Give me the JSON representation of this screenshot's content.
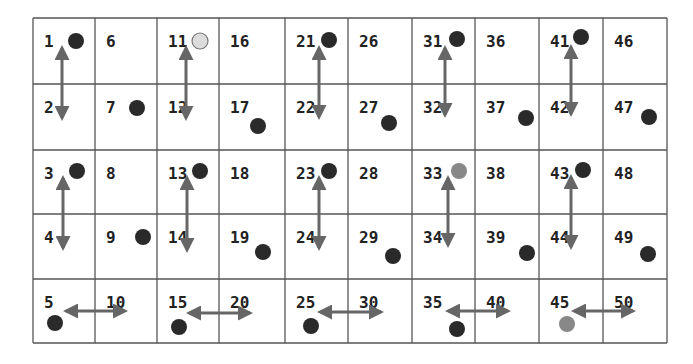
{
  "grid": {
    "columns": 10,
    "rows": 5,
    "col_edges": [
      33,
      95,
      157,
      219,
      285,
      348,
      412,
      475,
      539,
      603,
      667
    ],
    "row_edges": [
      18,
      84,
      150,
      214,
      279,
      343
    ],
    "line_color": "#555555",
    "background": "#ffffff"
  },
  "cells": [
    {
      "n": "1",
      "col": 0,
      "row": 0
    },
    {
      "n": "2",
      "col": 0,
      "row": 1
    },
    {
      "n": "3",
      "col": 0,
      "row": 2
    },
    {
      "n": "4",
      "col": 0,
      "row": 3
    },
    {
      "n": "5",
      "col": 0,
      "row": 4
    },
    {
      "n": "6",
      "col": 1,
      "row": 0
    },
    {
      "n": "7",
      "col": 1,
      "row": 1
    },
    {
      "n": "8",
      "col": 1,
      "row": 2
    },
    {
      "n": "9",
      "col": 1,
      "row": 3
    },
    {
      "n": "10",
      "col": 1,
      "row": 4
    },
    {
      "n": "11",
      "col": 2,
      "row": 0
    },
    {
      "n": "12",
      "col": 2,
      "row": 1
    },
    {
      "n": "13",
      "col": 2,
      "row": 2
    },
    {
      "n": "14",
      "col": 2,
      "row": 3
    },
    {
      "n": "15",
      "col": 2,
      "row": 4
    },
    {
      "n": "16",
      "col": 3,
      "row": 0
    },
    {
      "n": "17",
      "col": 3,
      "row": 1
    },
    {
      "n": "18",
      "col": 3,
      "row": 2
    },
    {
      "n": "19",
      "col": 3,
      "row": 3
    },
    {
      "n": "20",
      "col": 3,
      "row": 4
    },
    {
      "n": "21",
      "col": 4,
      "row": 0
    },
    {
      "n": "22",
      "col": 4,
      "row": 1
    },
    {
      "n": "23",
      "col": 4,
      "row": 2
    },
    {
      "n": "24",
      "col": 4,
      "row": 3
    },
    {
      "n": "25",
      "col": 4,
      "row": 4
    },
    {
      "n": "26",
      "col": 5,
      "row": 0
    },
    {
      "n": "27",
      "col": 5,
      "row": 1
    },
    {
      "n": "28",
      "col": 5,
      "row": 2
    },
    {
      "n": "29",
      "col": 5,
      "row": 3
    },
    {
      "n": "30",
      "col": 5,
      "row": 4
    },
    {
      "n": "31",
      "col": 6,
      "row": 0
    },
    {
      "n": "32",
      "col": 6,
      "row": 1
    },
    {
      "n": "33",
      "col": 6,
      "row": 2
    },
    {
      "n": "34",
      "col": 6,
      "row": 3
    },
    {
      "n": "35",
      "col": 6,
      "row": 4
    },
    {
      "n": "36",
      "col": 7,
      "row": 0
    },
    {
      "n": "37",
      "col": 7,
      "row": 1
    },
    {
      "n": "38",
      "col": 7,
      "row": 2
    },
    {
      "n": "39",
      "col": 7,
      "row": 3
    },
    {
      "n": "40",
      "col": 7,
      "row": 4
    },
    {
      "n": "41",
      "col": 8,
      "row": 0
    },
    {
      "n": "42",
      "col": 8,
      "row": 1
    },
    {
      "n": "43",
      "col": 8,
      "row": 2
    },
    {
      "n": "44",
      "col": 8,
      "row": 3
    },
    {
      "n": "45",
      "col": 8,
      "row": 4
    },
    {
      "n": "46",
      "col": 9,
      "row": 0
    },
    {
      "n": "47",
      "col": 9,
      "row": 1
    },
    {
      "n": "48",
      "col": 9,
      "row": 2
    },
    {
      "n": "49",
      "col": 9,
      "row": 3
    },
    {
      "n": "50",
      "col": 9,
      "row": 4
    }
  ],
  "dot_colors": {
    "dark": "#2a2a2a",
    "gray": "#888888",
    "light": "#dcdcdc"
  },
  "dots": [
    {
      "cell": "1",
      "x": 76,
      "y": 41,
      "color": "dark"
    },
    {
      "cell": "7",
      "x": 137,
      "y": 108,
      "color": "dark"
    },
    {
      "cell": "11",
      "x": 200,
      "y": 41,
      "color": "light"
    },
    {
      "cell": "17",
      "x": 258,
      "y": 126,
      "color": "dark"
    },
    {
      "cell": "21",
      "x": 329,
      "y": 40,
      "color": "dark"
    },
    {
      "cell": "27",
      "x": 389,
      "y": 123,
      "color": "dark"
    },
    {
      "cell": "31",
      "x": 457,
      "y": 39,
      "color": "dark"
    },
    {
      "cell": "37",
      "x": 526,
      "y": 118,
      "color": "dark"
    },
    {
      "cell": "41",
      "x": 581,
      "y": 37,
      "color": "dark"
    },
    {
      "cell": "47",
      "x": 649,
      "y": 117,
      "color": "dark"
    },
    {
      "cell": "3",
      "x": 77,
      "y": 171,
      "color": "dark"
    },
    {
      "cell": "9",
      "x": 143,
      "y": 237,
      "color": "dark"
    },
    {
      "cell": "13",
      "x": 200,
      "y": 171,
      "color": "dark"
    },
    {
      "cell": "19",
      "x": 263,
      "y": 252,
      "color": "dark"
    },
    {
      "cell": "23",
      "x": 329,
      "y": 171,
      "color": "dark"
    },
    {
      "cell": "29",
      "x": 393,
      "y": 256,
      "color": "dark"
    },
    {
      "cell": "33",
      "x": 459,
      "y": 171,
      "color": "gray"
    },
    {
      "cell": "39",
      "x": 527,
      "y": 253,
      "color": "dark"
    },
    {
      "cell": "43",
      "x": 583,
      "y": 170,
      "color": "dark"
    },
    {
      "cell": "49",
      "x": 648,
      "y": 254,
      "color": "dark"
    },
    {
      "cell": "5",
      "x": 55,
      "y": 323,
      "color": "dark"
    },
    {
      "cell": "15",
      "x": 179,
      "y": 327,
      "color": "dark"
    },
    {
      "cell": "25",
      "x": 311,
      "y": 326,
      "color": "dark"
    },
    {
      "cell": "35",
      "x": 457,
      "y": 329,
      "color": "dark"
    },
    {
      "cell": "45",
      "x": 567,
      "y": 324,
      "color": "gray"
    }
  ],
  "arrows": [
    {
      "from": "1",
      "to": "2",
      "x1": 62,
      "y1": 48,
      "x2": 62,
      "y2": 118
    },
    {
      "from": "11",
      "to": "12",
      "x1": 186,
      "y1": 48,
      "x2": 186,
      "y2": 118
    },
    {
      "from": "21",
      "to": "22",
      "x1": 319,
      "y1": 48,
      "x2": 319,
      "y2": 117
    },
    {
      "from": "31",
      "to": "32",
      "x1": 445,
      "y1": 48,
      "x2": 445,
      "y2": 115
    },
    {
      "from": "41",
      "to": "42",
      "x1": 571,
      "y1": 47,
      "x2": 571,
      "y2": 114
    },
    {
      "from": "3",
      "to": "4",
      "x1": 63,
      "y1": 178,
      "x2": 63,
      "y2": 248
    },
    {
      "from": "13",
      "to": "14",
      "x1": 187,
      "y1": 178,
      "x2": 187,
      "y2": 250
    },
    {
      "from": "23",
      "to": "24",
      "x1": 319,
      "y1": 178,
      "x2": 319,
      "y2": 248
    },
    {
      "from": "33",
      "to": "34",
      "x1": 448,
      "y1": 178,
      "x2": 448,
      "y2": 245
    },
    {
      "from": "43",
      "to": "44",
      "x1": 571,
      "y1": 177,
      "x2": 571,
      "y2": 247
    },
    {
      "from": "5",
      "to": "10",
      "x1": 66,
      "y1": 311,
      "x2": 125,
      "y2": 311
    },
    {
      "from": "15",
      "to": "20",
      "x1": 189,
      "y1": 313,
      "x2": 250,
      "y2": 313
    },
    {
      "from": "25",
      "to": "30",
      "x1": 320,
      "y1": 312,
      "x2": 381,
      "y2": 312
    },
    {
      "from": "35",
      "to": "40",
      "x1": 448,
      "y1": 311,
      "x2": 508,
      "y2": 311
    },
    {
      "from": "45",
      "to": "50",
      "x1": 574,
      "y1": 311,
      "x2": 633,
      "y2": 311
    }
  ],
  "arrow_color": "#666666"
}
